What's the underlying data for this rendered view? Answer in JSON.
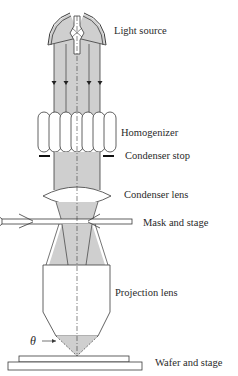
{
  "colors": {
    "beam_fill": "#cfcfcf",
    "stroke": "#3a3a3a",
    "background": "#ffffff"
  },
  "labels": {
    "light_source": "Light source",
    "homogenizer": "Homogenizer",
    "condenser_stop": "Condenser stop",
    "condenser_lens": "Condenser lens",
    "mask_and_stage": "Mask and stage",
    "projection_lens": "Projection lens",
    "wafer_and_stage": "Wafer and stage",
    "theta": "θ"
  },
  "components": [
    {
      "name": "Light source",
      "type": "lamp-with-reflector"
    },
    {
      "name": "Homogenizer",
      "type": "lens-array",
      "lenslets": 7
    },
    {
      "name": "Condenser stop",
      "type": "aperture"
    },
    {
      "name": "Condenser lens",
      "type": "biconvex-lens"
    },
    {
      "name": "Mask and stage",
      "type": "plate"
    },
    {
      "name": "Projection lens",
      "type": "objective"
    },
    {
      "name": "Wafer and stage",
      "type": "substrate"
    }
  ],
  "annotations": {
    "ray_arrows": 4,
    "optical_axis": "dash-dot centerline",
    "angle_symbol": "θ"
  }
}
